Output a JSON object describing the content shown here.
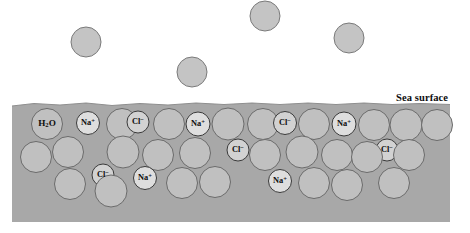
{
  "figure": {
    "kind": "seawater-molecular-diagram",
    "sea_surface_label": "Sea surface",
    "colors": {
      "page_background": "#ffffff",
      "water_body": "#a8a8a8",
      "water_molecule_fill": "#c0c0c0",
      "water_molecule_stroke": "#6b6b6b",
      "sodium_ion_fill": "#dedede",
      "sodium_ion_stroke": "#3f3f3f",
      "chloride_ion_fill": "#d2d2d2",
      "chloride_ion_stroke": "#3a3a3a",
      "free_molecule_fill": "#c4c4c4",
      "free_molecule_stroke": "#7a7a7a",
      "label_text": "#0d0d0d",
      "surface_line": "#8f8f8f"
    },
    "species": {
      "water": "H2O",
      "sodium": "Na+",
      "chloride": "Cl-"
    },
    "water_body": {
      "left": 12,
      "right": 450,
      "top": 104,
      "bottom": 222
    },
    "sea_surface_label_pos": {
      "x": 396,
      "y": 92
    },
    "surface_wave_points": "12,106 34,103.5 60,105 86,103 112,105.5 140,103.5 168,105 196,103 224,104.5 252,103 280,104.5 308,103 336,104.5 364,103 392,104.5 420,103.5 450,104.5",
    "free_molecules": [
      {
        "name": "evaporated-water-1",
        "cx": 86,
        "cy": 42,
        "r": 15
      },
      {
        "name": "evaporated-water-2",
        "cx": 265,
        "cy": 16,
        "r": 15
      },
      {
        "name": "evaporated-water-3",
        "cx": 349,
        "cy": 38,
        "r": 15
      },
      {
        "name": "evaporated-water-4",
        "cx": 192,
        "cy": 72,
        "r": 15
      }
    ],
    "dissolved_particles": [
      {
        "name": "water-molecule",
        "type": "water",
        "cx": 47,
        "cy": 124,
        "r": 15.5,
        "label": "H2O"
      },
      {
        "name": "sodium-ion",
        "type": "sodium",
        "cx": 88,
        "cy": 123,
        "r": 11.5,
        "label": "Na+"
      },
      {
        "name": "water-molecule",
        "type": "water",
        "cx": 122,
        "cy": 124,
        "r": 15.5,
        "label": ""
      },
      {
        "name": "chloride-ion",
        "type": "chloride",
        "cx": 138,
        "cy": 122,
        "r": 11.0,
        "label": "Cl-"
      },
      {
        "name": "water-molecule",
        "type": "water",
        "cx": 169,
        "cy": 124,
        "r": 15.5,
        "label": ""
      },
      {
        "name": "sodium-ion",
        "type": "sodium",
        "cx": 198,
        "cy": 124,
        "r": 12.0,
        "label": "Na+"
      },
      {
        "name": "water-molecule",
        "type": "water",
        "cx": 228,
        "cy": 124,
        "r": 16.0,
        "label": ""
      },
      {
        "name": "water-molecule",
        "type": "water",
        "cx": 263,
        "cy": 124,
        "r": 15.5,
        "label": ""
      },
      {
        "name": "chloride-ion",
        "type": "chloride",
        "cx": 285,
        "cy": 123,
        "r": 11.5,
        "label": "Cl-"
      },
      {
        "name": "water-molecule",
        "type": "water",
        "cx": 314,
        "cy": 124,
        "r": 15.5,
        "label": ""
      },
      {
        "name": "sodium-ion",
        "type": "sodium",
        "cx": 344,
        "cy": 124,
        "r": 12.0,
        "label": "Na+"
      },
      {
        "name": "water-molecule",
        "type": "water",
        "cx": 374,
        "cy": 125,
        "r": 15.5,
        "label": ""
      },
      {
        "name": "water-molecule",
        "type": "water",
        "cx": 406,
        "cy": 125,
        "r": 16.0,
        "label": ""
      },
      {
        "name": "water-molecule",
        "type": "water",
        "cx": 437,
        "cy": 125,
        "r": 15.5,
        "label": ""
      },
      {
        "name": "water-molecule",
        "type": "water",
        "cx": 36,
        "cy": 157,
        "r": 15.5,
        "label": ""
      },
      {
        "name": "water-molecule",
        "type": "water",
        "cx": 68,
        "cy": 152,
        "r": 15.5,
        "label": ""
      },
      {
        "name": "water-molecule",
        "type": "water",
        "cx": 123,
        "cy": 152,
        "r": 16.0,
        "label": ""
      },
      {
        "name": "chloride-ion",
        "type": "chloride",
        "cx": 103,
        "cy": 175,
        "r": 11.0,
        "label": "Cl-"
      },
      {
        "name": "water-molecule",
        "type": "water",
        "cx": 158,
        "cy": 155,
        "r": 15.5,
        "label": ""
      },
      {
        "name": "water-molecule",
        "type": "water",
        "cx": 195,
        "cy": 153,
        "r": 15.5,
        "label": ""
      },
      {
        "name": "chloride-ion",
        "type": "chloride",
        "cx": 238,
        "cy": 150,
        "r": 11.0,
        "label": "Cl-"
      },
      {
        "name": "water-molecule",
        "type": "water",
        "cx": 265,
        "cy": 155,
        "r": 15.5,
        "label": ""
      },
      {
        "name": "water-molecule",
        "type": "water",
        "cx": 302,
        "cy": 152,
        "r": 16.0,
        "label": ""
      },
      {
        "name": "water-molecule",
        "type": "water",
        "cx": 337,
        "cy": 155,
        "r": 15.5,
        "label": ""
      },
      {
        "name": "chloride-ion",
        "type": "chloride",
        "cx": 387,
        "cy": 150,
        "r": 11.0,
        "label": "Cl-"
      },
      {
        "name": "water-molecule",
        "type": "water",
        "cx": 367,
        "cy": 157,
        "r": 15.5,
        "label": ""
      },
      {
        "name": "water-molecule",
        "type": "water",
        "cx": 409,
        "cy": 155,
        "r": 15.5,
        "label": ""
      },
      {
        "name": "water-molecule",
        "type": "water",
        "cx": 70,
        "cy": 184,
        "r": 15.5,
        "label": ""
      },
      {
        "name": "water-molecule",
        "type": "water",
        "cx": 111,
        "cy": 191,
        "r": 16.0,
        "label": ""
      },
      {
        "name": "sodium-ion",
        "type": "sodium",
        "cx": 145,
        "cy": 178,
        "r": 11.5,
        "label": "Na+"
      },
      {
        "name": "water-molecule",
        "type": "water",
        "cx": 182,
        "cy": 183,
        "r": 15.5,
        "label": ""
      },
      {
        "name": "water-molecule",
        "type": "water",
        "cx": 215,
        "cy": 182,
        "r": 15.5,
        "label": ""
      },
      {
        "name": "sodium-ion",
        "type": "sodium",
        "cx": 280,
        "cy": 181,
        "r": 11.5,
        "label": "Na+"
      },
      {
        "name": "water-molecule",
        "type": "water",
        "cx": 314,
        "cy": 183,
        "r": 15.5,
        "label": ""
      },
      {
        "name": "water-molecule",
        "type": "water",
        "cx": 347,
        "cy": 185,
        "r": 15.5,
        "label": ""
      },
      {
        "name": "water-molecule",
        "type": "water",
        "cx": 394,
        "cy": 183,
        "r": 15.5,
        "label": ""
      }
    ]
  }
}
